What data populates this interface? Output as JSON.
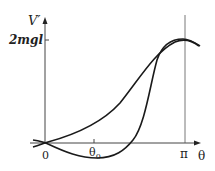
{
  "figure": {
    "y_axis_label": "V′",
    "y_tick_label": "2mgl",
    "x_axis_label": "θ",
    "x_ticks": {
      "origin": "0",
      "theta0": "θ",
      "theta0_sub": "0",
      "pi": "π"
    }
  },
  "colors": {
    "stroke": "#1a1a1a",
    "axis": "#444444"
  }
}
